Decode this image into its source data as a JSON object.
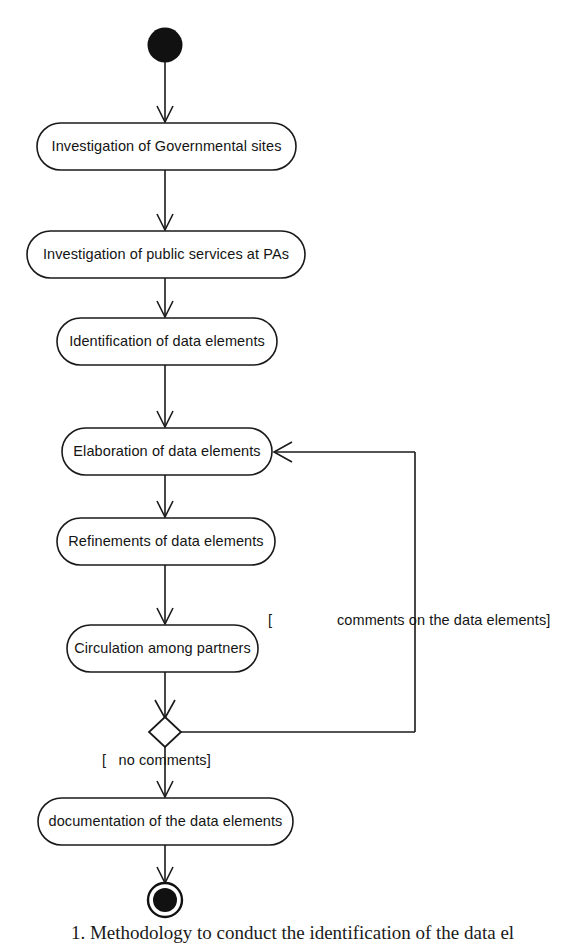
{
  "diagram": {
    "type": "uml-activity-diagram",
    "background_color": "#ffffff",
    "line_color": "#1a1a1a",
    "nodes": {
      "start": {
        "name": "initial-node",
        "shape": "filled-circle"
      },
      "end": {
        "name": "final-node",
        "shape": "bullseye-circle"
      },
      "decision": {
        "name": "decision-diamond",
        "shape": "diamond"
      }
    },
    "activities": [
      {
        "id": "a1",
        "label": "Investigation of Governmental sites"
      },
      {
        "id": "a2",
        "label": "Investigation of public services at PAs"
      },
      {
        "id": "a3",
        "label": "Identification of data elements"
      },
      {
        "id": "a4",
        "label": "Elaboration of data elements"
      },
      {
        "id": "a5",
        "label": "Refinements of data elements"
      },
      {
        "id": "a6",
        "label": "Circulation among partners"
      },
      {
        "id": "a7",
        "label": "documentation of the data elements"
      }
    ],
    "guards": [
      {
        "id": "g1",
        "label": "[",
        "note": "open-bracket of comments guard"
      },
      {
        "id": "g2",
        "label": "comments on the data elements]"
      },
      {
        "id": "g3",
        "label": "[   no comments]"
      }
    ]
  },
  "caption": {
    "text": "1. Methodology to conduct the identification of the data el"
  }
}
